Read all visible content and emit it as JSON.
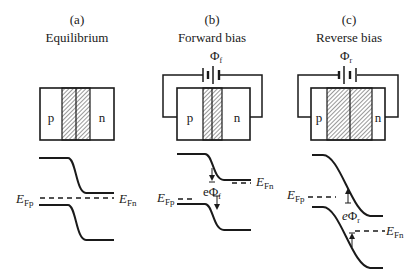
{
  "panels": [
    {
      "id": "a",
      "letter": "(a)",
      "title": "Equilibrium",
      "region_left": "p",
      "region_right": "n",
      "fermi_left": {
        "main": "E",
        "sub": "Fp"
      },
      "fermi_right": {
        "main": "E",
        "sub": "Fn"
      }
    },
    {
      "id": "b",
      "letter": "(b)",
      "title": "Forward bias",
      "voltage": {
        "main": "Φ",
        "sub": "f"
      },
      "region_left": "p",
      "region_right": "n",
      "fermi_left": {
        "main": "E",
        "sub": "Fp"
      },
      "fermi_right": {
        "main": "E",
        "sub": "Fn"
      },
      "energy_label": {
        "prefix": "e",
        "main": "Φ",
        "sub": "f"
      }
    },
    {
      "id": "c",
      "letter": "(c)",
      "title": "Reverse bias",
      "voltage": {
        "main": "Φ",
        "sub": "r"
      },
      "region_left": "p",
      "region_right": "n",
      "fermi_left": {
        "main": "E",
        "sub": "Fp"
      },
      "fermi_right": {
        "main": "E",
        "sub": "Fn"
      },
      "energy_label": {
        "prefix": "e",
        "main": "Φ",
        "sub": "r"
      }
    }
  ],
  "colors": {
    "stroke": "#1a1a1a",
    "hatch": "#555555",
    "background": "#ffffff"
  }
}
